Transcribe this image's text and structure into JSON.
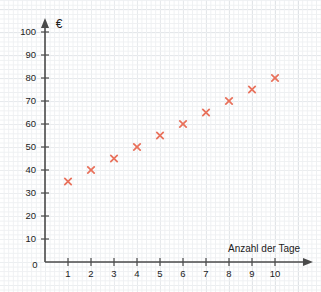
{
  "chart_data": {
    "type": "scatter",
    "title": "",
    "xlabel": "Anzahl der Tage",
    "ylabel": "€",
    "x": [
      1,
      2,
      3,
      4,
      5,
      6,
      7,
      8,
      9,
      10
    ],
    "values": [
      35,
      40,
      45,
      50,
      55,
      60,
      65,
      70,
      75,
      80
    ],
    "series": [
      {
        "name": "",
        "values": [
          35,
          40,
          45,
          50,
          55,
          60,
          65,
          70,
          75,
          80
        ]
      }
    ],
    "xlim": [
      0,
      11
    ],
    "ylim": [
      0,
      105
    ],
    "x_ticks": [
      "1",
      "2",
      "3",
      "4",
      "5",
      "6",
      "7",
      "8",
      "9",
      "10"
    ],
    "y_ticks": [
      "10",
      "20",
      "30",
      "40",
      "50",
      "60",
      "70",
      "80",
      "90",
      "100"
    ],
    "origin_label": "0",
    "grid": true,
    "legend": "none",
    "marker": "x",
    "marker_color": "#e8705a",
    "axis_color": "#4a4a4a",
    "grid_major_color": "#ccd1d6",
    "grid_minor_color": "#eef0f2"
  }
}
